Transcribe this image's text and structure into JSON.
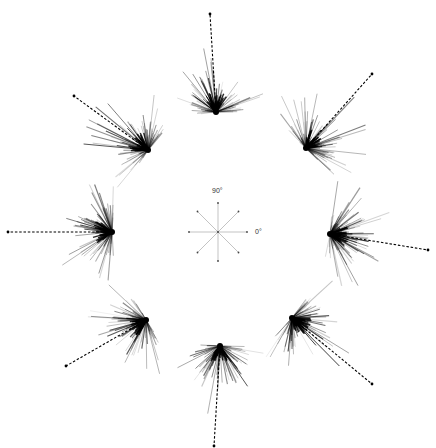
{
  "figure": {
    "type": "radial vector field / directional fan plot",
    "center": {
      "x": 218,
      "y": 232
    },
    "center_key": {
      "labels": {
        "top": "90°",
        "right": "0°"
      },
      "directions_deg": [
        0,
        45,
        90,
        135,
        180,
        225,
        270,
        315
      ]
    },
    "groups": [
      {
        "name": "north",
        "cx": 216,
        "cy": 112,
        "dash_end": {
          "x": 210,
          "y": 14
        }
      },
      {
        "name": "north-east",
        "cx": 306,
        "cy": 148,
        "dash_end": {
          "x": 372,
          "y": 74
        }
      },
      {
        "name": "east",
        "cx": 330,
        "cy": 234,
        "dash_end": {
          "x": 428,
          "y": 250
        }
      },
      {
        "name": "south-east",
        "cx": 292,
        "cy": 318,
        "dash_end": {
          "x": 372,
          "y": 384
        }
      },
      {
        "name": "south",
        "cx": 220,
        "cy": 346,
        "dash_end": {
          "x": 214,
          "y": 446
        }
      },
      {
        "name": "south-west",
        "cx": 146,
        "cy": 320,
        "dash_end": {
          "x": 66,
          "y": 366
        }
      },
      {
        "name": "west",
        "cx": 112,
        "cy": 232,
        "dash_end": {
          "x": 8,
          "y": 232
        }
      },
      {
        "name": "north-west",
        "cx": 148,
        "cy": 150,
        "dash_end": {
          "x": 74,
          "y": 96
        }
      }
    ],
    "colors": {
      "ink": "#000000",
      "faint": "#9a9a9a",
      "background": "#ffffff"
    }
  }
}
